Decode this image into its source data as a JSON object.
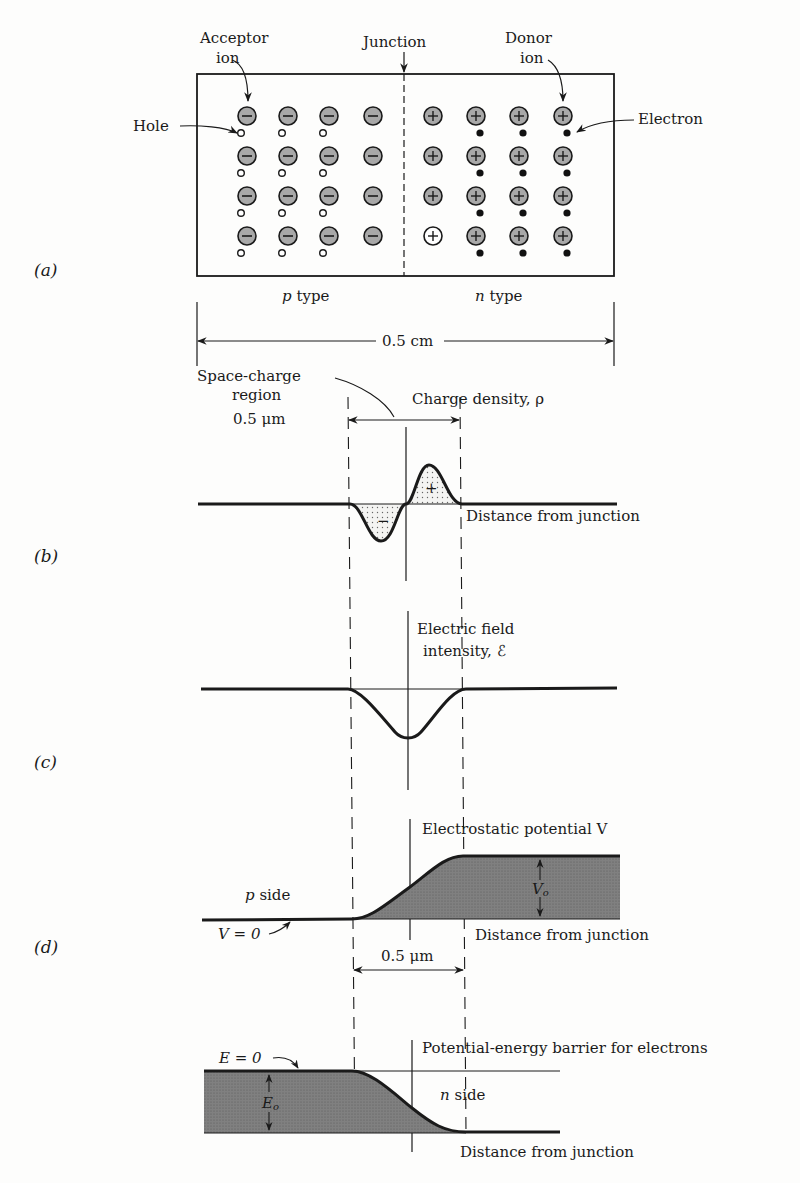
{
  "panels": {
    "a": {
      "label": "(a)",
      "acceptor_label_1": "Acceptor",
      "acceptor_label_2": "ion",
      "junction_label": "Junction",
      "donor_label_1": "Donor",
      "donor_label_2": "ion",
      "hole_label": "Hole",
      "electron_label": "Electron",
      "p_type_prefix": "p",
      "p_type_suffix": " type",
      "n_type_prefix": "n",
      "n_type_suffix": " type",
      "width_label": "0.5 cm",
      "acceptor_symbol": "−",
      "donor_symbol": "+",
      "rows": 4,
      "columns_per_side": 4
    },
    "b": {
      "label": "(b)",
      "region_label_1": "Space-charge",
      "region_label_2": "region",
      "region_label_3": "0.5 μm",
      "curve_label": "Charge density, ρ",
      "axis_label": "Distance from junction",
      "neg_sign": "−",
      "pos_sign": "+"
    },
    "c": {
      "label": "(c)",
      "curve_label_1": "Electric field",
      "curve_label_2": "intensity, ℰ"
    },
    "d": {
      "label": "(d)",
      "curve_label": "Electrostatic potential V",
      "p_side_prefix": "p",
      "p_side_suffix": " side",
      "zero_label": "V = 0",
      "barrier_label": "V",
      "barrier_sub": "o",
      "axis_label": "Distance from junction",
      "width_label": "0.5 μm"
    },
    "e": {
      "curve_label": "Potential-energy barrier for electrons",
      "zero_label": "E = 0",
      "barrier_label": "E",
      "barrier_sub": "o",
      "n_side_prefix": "n",
      "n_side_suffix": " side",
      "axis_label": "Distance from junction"
    }
  },
  "colors": {
    "ink": "#1a1a1a",
    "ion_fill": "#a8a8a8",
    "shade_fill": "#7a7a7a",
    "dot_fill": "#d8d8d8"
  }
}
